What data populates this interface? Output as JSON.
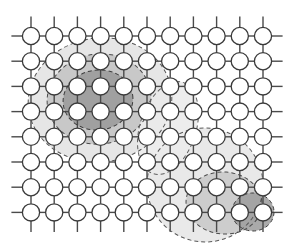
{
  "figure": {
    "background_color": "#ffffff",
    "width": 285,
    "height": 248
  },
  "lattice": {
    "type": "square-lattice",
    "columns": 11,
    "rows": 8,
    "origin_x": 31,
    "origin_y": 36,
    "spacing_x": 23.2,
    "spacing_y": 25.2,
    "node_radius": 8.6,
    "node_fill": "#ffffff",
    "node_stroke": "#3a3a3a",
    "node_stroke_width": 1.3,
    "bond_stroke": "#4a4a4a",
    "bond_stroke_width": 1.4,
    "stub_length": 11
  },
  "regions": [
    {
      "name": "left-cluster-outer",
      "shade_label": "outer halo",
      "fill": "#e2e2e2",
      "dash_stroke": "#555555",
      "cx": 100,
      "cy": 100,
      "rx": 72,
      "ry": 62,
      "rotation": -8,
      "dashed": true
    },
    {
      "name": "left-cluster-middle",
      "shade_label": "middle shell",
      "fill": "#c4c4c4",
      "dash_stroke": "#4a4a4a",
      "cx": 99,
      "cy": 99,
      "rx": 52,
      "ry": 45,
      "rotation": -8,
      "dashed": true
    },
    {
      "name": "left-cluster-core",
      "shade_label": "dark core",
      "fill": "#9a9a9a",
      "dash_stroke": "#3c3c3c",
      "cx": 98,
      "cy": 100,
      "rx": 35,
      "ry": 30,
      "rotation": -8,
      "dashed": true
    },
    {
      "name": "right-cluster-outer",
      "shade_label": "outer halo",
      "fill": "#e6e6e6",
      "dash_stroke": "#585858",
      "cx": 205,
      "cy": 185,
      "rx": 58,
      "ry": 57,
      "rotation": 6,
      "dashed": true
    },
    {
      "name": "right-cluster-middle",
      "shade_label": "middle shell",
      "fill": "#c8c8c8",
      "dash_stroke": "#4a4a4a",
      "cx": 224,
      "cy": 203,
      "rx": 38,
      "ry": 31,
      "rotation": 4,
      "dashed": true
    },
    {
      "name": "right-cluster-core",
      "shade_label": "dark core",
      "fill": "#9e9e9e",
      "dash_stroke": "#3c3c3c",
      "cx": 253,
      "cy": 212,
      "rx": 21,
      "ry": 19,
      "rotation": 0,
      "dashed": true
    },
    {
      "name": "connecting-lobe",
      "shade_label": "linking channel",
      "fill": "#ebebeb",
      "dash_stroke": "#606060",
      "cx": 168,
      "cy": 128,
      "rx": 28,
      "ry": 48,
      "rotation": 18,
      "dashed": true
    }
  ],
  "colors": {
    "shade_light": "#e6e6e6",
    "shade_medium": "#c6c6c6",
    "shade_dark": "#9a9a9a",
    "node_outline": "#3a3a3a",
    "bond": "#4a4a4a",
    "dash_outline": "#505050",
    "page_background": "#ffffff"
  }
}
